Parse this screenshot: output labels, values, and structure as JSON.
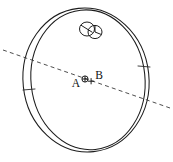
{
  "figure": {
    "background_color": "#ffffff",
    "line_color": "#1c1c1c",
    "dash_color": "#3a3a3a",
    "labels": [
      {
        "id": "label-a",
        "text": "A",
        "x": 76,
        "y": 87
      },
      {
        "id": "label-b",
        "text": "B",
        "x": 95,
        "y": 79
      }
    ],
    "markers": [
      {
        "id": "marker-circle-plus",
        "type": "circle-plus",
        "cx": 85,
        "cy": 79,
        "r": 3.1
      },
      {
        "id": "marker-plus",
        "type": "plus",
        "cx": 91,
        "cy": 81,
        "size": 3.2
      }
    ],
    "small_circles": [
      {
        "id": "small-circle-left",
        "cx": 87,
        "cy": 29,
        "rx": 7.5,
        "ry": 7.0
      },
      {
        "id": "small-circle-right",
        "cx": 95,
        "cy": 32,
        "rx": 7.0,
        "ry": 6.6
      }
    ],
    "axis_line": {
      "id": "dashed-axis",
      "x1": 3,
      "y1": 50,
      "x2": 170,
      "y2": 108
    },
    "ring": {
      "outer_rx": 63,
      "outer_ry": 72,
      "inner_rx": 57,
      "inner_ry": 67,
      "cx": 86,
      "cy": 80,
      "rotation_deg": -6
    }
  }
}
